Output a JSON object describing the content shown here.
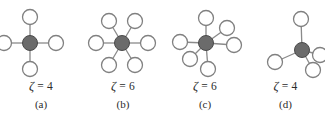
{
  "figure": {
    "background_color": "#ffffff",
    "hub_color": "#6b6b6b",
    "hub_stroke_color": "#4a4a4a",
    "node_fill_color": "#ffffff",
    "node_stroke_color": "#808080",
    "edge_color": "#8a8a8a",
    "text_color": "#2b2b2b"
  },
  "panels": [
    {
      "id": "a",
      "zeta_label": "ζ = 4",
      "zeta_symbol": "ζ",
      "zeta_equals": "=",
      "zeta_value": "4",
      "index_label": "(a)",
      "coordination_number": 4,
      "center": {
        "x": 30,
        "y": 43
      },
      "hub_radius": 7.5,
      "node_radius": 7.5,
      "neighbors": [
        {
          "name": "up",
          "x": 30,
          "y": 17
        },
        {
          "name": "right",
          "x": 56,
          "y": 43
        },
        {
          "name": "down",
          "x": 30,
          "y": 69
        },
        {
          "name": "left",
          "x": 4,
          "y": 43
        }
      ]
    },
    {
      "id": "b",
      "zeta_label": "ζ = 6",
      "zeta_symbol": "ζ",
      "zeta_equals": "=",
      "zeta_value": "6",
      "index_label": "(b)",
      "coordination_number": 6,
      "center": {
        "x": 122,
        "y": 43
      },
      "hub_radius": 7.5,
      "node_radius": 7.5,
      "neighbors": [
        {
          "name": "upper-right",
          "x": 135,
          "y": 21
        },
        {
          "name": "right",
          "x": 148,
          "y": 43
        },
        {
          "name": "lower-right",
          "x": 135,
          "y": 65
        },
        {
          "name": "lower-left",
          "x": 109,
          "y": 65
        },
        {
          "name": "left",
          "x": 96,
          "y": 43
        },
        {
          "name": "upper-left",
          "x": 109,
          "y": 21
        }
      ]
    },
    {
      "id": "c",
      "zeta_label": "ζ = 6",
      "zeta_symbol": "ζ",
      "zeta_equals": "=",
      "zeta_value": "6",
      "index_label": "(c)",
      "coordination_number": 6,
      "center": {
        "x": 206,
        "y": 43
      },
      "hub_radius": 7.5,
      "node_radius": 7.5,
      "neighbors": [
        {
          "name": "up",
          "x": 206,
          "y": 18
        },
        {
          "name": "upper-right-short",
          "x": 227,
          "y": 28
        },
        {
          "name": "right",
          "x": 234,
          "y": 45
        },
        {
          "name": "down",
          "x": 208,
          "y": 69
        },
        {
          "name": "lower-left-short",
          "x": 190,
          "y": 59
        },
        {
          "name": "left",
          "x": 180,
          "y": 42
        }
      ]
    },
    {
      "id": "d",
      "zeta_label": "ζ = 4",
      "zeta_symbol": "ζ",
      "zeta_equals": "=",
      "zeta_value": "4",
      "index_label": "(d)",
      "coordination_number": 4,
      "center": {
        "x": 302,
        "y": 50
      },
      "hub_radius": 7.5,
      "node_radius": 7.5,
      "neighbors": [
        {
          "name": "up",
          "x": 301,
          "y": 19
        },
        {
          "name": "right-close",
          "x": 320,
          "y": 55
        },
        {
          "name": "lower-right",
          "x": 313,
          "y": 70
        },
        {
          "name": "lower-left",
          "x": 275,
          "y": 62
        }
      ]
    }
  ]
}
